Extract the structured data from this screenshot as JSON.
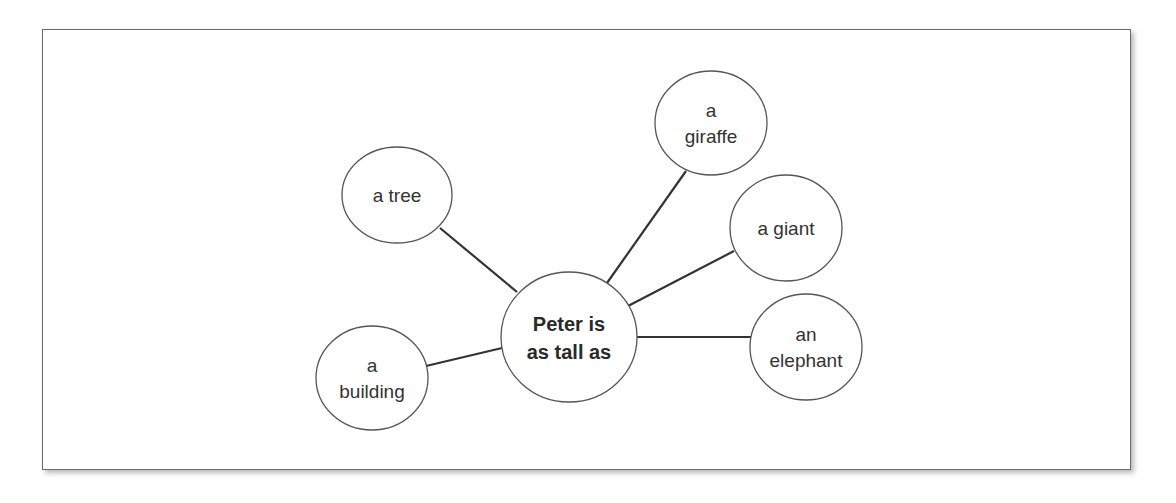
{
  "diagram": {
    "type": "word-web",
    "center": {
      "lines": [
        "Peter is",
        "as tall as"
      ]
    },
    "nodes": [
      {
        "id": "tree",
        "lines": [
          "a tree"
        ]
      },
      {
        "id": "building",
        "lines": [
          "a",
          "building"
        ]
      },
      {
        "id": "giraffe",
        "lines": [
          "a",
          "giraffe"
        ]
      },
      {
        "id": "giant",
        "lines": [
          "a giant"
        ]
      },
      {
        "id": "elephant",
        "lines": [
          "an",
          "elephant"
        ]
      }
    ]
  },
  "colors": {
    "stroke": "#555555",
    "connector": "#333333",
    "text": "#333333",
    "background": "#ffffff"
  }
}
